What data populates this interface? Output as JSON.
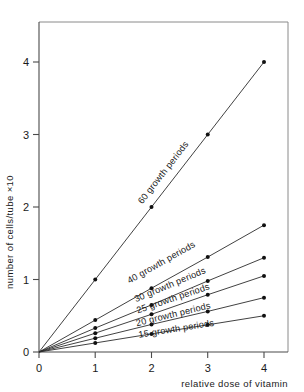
{
  "chart_data": {
    "type": "line",
    "title": "",
    "subtitle": "",
    "xlabel": "relative dose of vitamin",
    "ylabel": "number of cells/tube ×10",
    "xlim": [
      0,
      4.4
    ],
    "ylim": [
      0,
      4.55
    ],
    "xticks": [
      "0",
      "1",
      "2",
      "3",
      "4"
    ],
    "xtick_values": [
      0,
      1,
      2,
      3,
      4
    ],
    "yticks": [
      "0",
      "1",
      "2",
      "3",
      "4"
    ],
    "ytick_values": [
      0,
      1,
      2,
      3,
      4
    ],
    "grid": false,
    "legend": "inline-labels",
    "x": [
      0,
      1,
      2,
      3,
      4
    ],
    "series": [
      {
        "name": "60 growth periods",
        "values": [
          0,
          1.0,
          2.0,
          3.0,
          4.0
        ],
        "label": "60 growth periods",
        "label_x": 2.25,
        "label_y": 2.45
      },
      {
        "name": "40 growth periods",
        "values": [
          0,
          0.44,
          0.88,
          1.31,
          1.75
        ],
        "label": "40 growth periods",
        "label_x": 2.2,
        "label_y": 1.2
      },
      {
        "name": "30 growth periods",
        "values": [
          0,
          0.33,
          0.65,
          0.98,
          1.3
        ],
        "label": "30 growth periods",
        "label_x": 2.35,
        "label_y": 0.89
      },
      {
        "name": "25 growth periods",
        "values": [
          0,
          0.26,
          0.52,
          0.79,
          1.05
        ],
        "label": "25 growth periods",
        "label_x": 2.4,
        "label_y": 0.7
      },
      {
        "name": "20 growth periods",
        "values": [
          0,
          0.19,
          0.38,
          0.56,
          0.75
        ],
        "label": "20 growth periods",
        "label_x": 2.4,
        "label_y": 0.48
      },
      {
        "name": "15 growth periods",
        "values": [
          0,
          0.125,
          0.25,
          0.375,
          0.5
        ],
        "label": "15 growth periods",
        "label_x": 2.45,
        "label_y": 0.28
      }
    ]
  },
  "axes": {
    "y_title": "number of cells/tube ×10",
    "x_title": "relative dose of vitamin",
    "y_tick_0": "0",
    "y_tick_1": "1",
    "y_tick_2": "2",
    "y_tick_3": "3",
    "y_tick_4": "4",
    "x_tick_0": "0",
    "x_tick_1": "1",
    "x_tick_2": "2",
    "x_tick_3": "3",
    "x_tick_4": "4"
  },
  "series_labels": {
    "s60": "60 growth periods",
    "s40": "40 growth periods",
    "s30": "30 growth periods",
    "s25": "25 growth periods",
    "s20": "20 growth periods",
    "s15": "15 growth periods"
  },
  "colors": {
    "line": "#2b2b2b",
    "axis": "#4a4a4a",
    "box": "#8a8a8a",
    "marker": "#111111",
    "background": "#ffffff"
  }
}
